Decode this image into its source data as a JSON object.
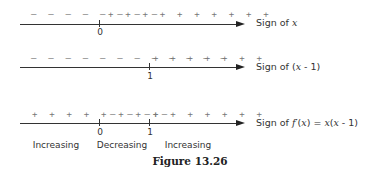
{
  "figure": {
    "caption": "Figure 13.26",
    "rows": [
      {
        "label": "Sign of x",
        "signs": [
          {
            "text": "– – – – – – – –",
            "sign": "negative",
            "count": 8
          },
          {
            "text": "+ + + + + + + + + +",
            "sign": "positive",
            "count": 10
          }
        ],
        "ticks": [
          {
            "value": "0"
          }
        ]
      },
      {
        "label": "Sign of (x - 1)",
        "signs": [
          {
            "text": "– – – – – – – – – – – –",
            "sign": "negative",
            "count": 12
          },
          {
            "text": "+ + + + + + +",
            "sign": "positive",
            "count": 7
          }
        ],
        "ticks": [
          {
            "value": "1"
          }
        ]
      },
      {
        "label": "Sign of f′(x) = x(x - 1)",
        "signs": [
          {
            "text": "+ + + + + + + +",
            "sign": "positive",
            "count": 8
          },
          {
            "text": "– – – –",
            "sign": "negative",
            "count": 4
          },
          {
            "text": "+ + + + + + +",
            "sign": "positive",
            "count": 7
          }
        ],
        "ticks": [
          {
            "value": "0"
          },
          {
            "value": "1"
          }
        ],
        "regions": [
          "Increasing",
          "Decreasing",
          "Increasing"
        ]
      }
    ]
  }
}
